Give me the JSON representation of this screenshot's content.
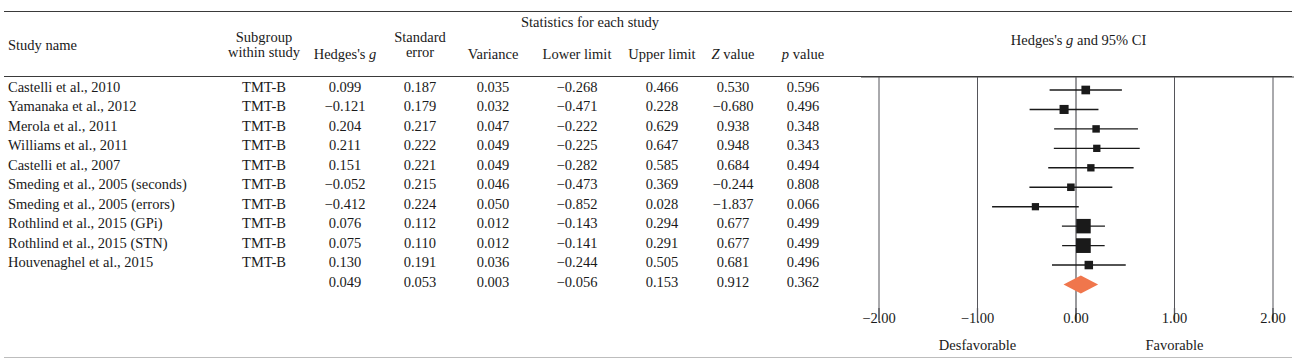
{
  "table": {
    "group_header": "Statistics for each study",
    "columns": [
      {
        "key": "study_name",
        "label": "Study name",
        "label2": ""
      },
      {
        "key": "subgroup",
        "label": "Subgroup",
        "label2": "within study"
      },
      {
        "key": "hedges_g",
        "label": "Hedges's g",
        "label2": ""
      },
      {
        "key": "standard_err",
        "label": "Standard",
        "label2": "error"
      },
      {
        "key": "variance",
        "label": "Variance",
        "label2": ""
      },
      {
        "key": "lower_limit",
        "label": "Lower limit",
        "label2": ""
      },
      {
        "key": "upper_limit",
        "label": "Upper limit",
        "label2": ""
      },
      {
        "key": "z_value",
        "label": "Z value",
        "label2": ""
      },
      {
        "key": "p_value",
        "label": "p value",
        "label2": ""
      }
    ],
    "rows": [
      {
        "study_name": "Castelli et al., 2010",
        "subgroup": "TMT-B",
        "hedges_g": "0.099",
        "standard_err": "0.187",
        "variance": "0.035",
        "lower_limit": "−0.268",
        "upper_limit": "0.466",
        "z_value": "0.530",
        "p_value": "0.596"
      },
      {
        "study_name": "Yamanaka et al., 2012",
        "subgroup": "TMT-B",
        "hedges_g": "−0.121",
        "standard_err": "0.179",
        "variance": "0.032",
        "lower_limit": "−0.471",
        "upper_limit": "0.228",
        "z_value": "−0.680",
        "p_value": "0.496"
      },
      {
        "study_name": "Merola et al., 2011",
        "subgroup": "TMT-B",
        "hedges_g": "0.204",
        "standard_err": "0.217",
        "variance": "0.047",
        "lower_limit": "−0.222",
        "upper_limit": "0.629",
        "z_value": "0.938",
        "p_value": "0.348"
      },
      {
        "study_name": "Williams et al., 2011",
        "subgroup": "TMT-B",
        "hedges_g": "0.211",
        "standard_err": "0.222",
        "variance": "0.049",
        "lower_limit": "−0.225",
        "upper_limit": "0.647",
        "z_value": "0.948",
        "p_value": "0.343"
      },
      {
        "study_name": "Castelli et al., 2007",
        "subgroup": "TMT-B",
        "hedges_g": "0.151",
        "standard_err": "0.221",
        "variance": "0.049",
        "lower_limit": "−0.282",
        "upper_limit": "0.585",
        "z_value": "0.684",
        "p_value": "0.494"
      },
      {
        "study_name": "Smeding et al., 2005 (seconds)",
        "subgroup": "TMT-B",
        "hedges_g": "−0.052",
        "standard_err": "0.215",
        "variance": "0.046",
        "lower_limit": "−0.473",
        "upper_limit": "0.369",
        "z_value": "−0.244",
        "p_value": "0.808"
      },
      {
        "study_name": "Smeding et al., 2005 (errors)",
        "subgroup": "TMT-B",
        "hedges_g": "−0.412",
        "standard_err": "0.224",
        "variance": "0.050",
        "lower_limit": "−0.852",
        "upper_limit": "0.028",
        "z_value": "−1.837",
        "p_value": "0.066"
      },
      {
        "study_name": "Rothlind et al., 2015 (GPi)",
        "subgroup": "TMT-B",
        "hedges_g": "0.076",
        "standard_err": "0.112",
        "variance": "0.012",
        "lower_limit": "−0.143",
        "upper_limit": "0.294",
        "z_value": "0.677",
        "p_value": "0.499"
      },
      {
        "study_name": "Rothlind et al., 2015 (STN)",
        "subgroup": "TMT-B",
        "hedges_g": "0.075",
        "standard_err": "0.110",
        "variance": "0.012",
        "lower_limit": "−0.141",
        "upper_limit": "0.291",
        "z_value": "0.677",
        "p_value": "0.499"
      },
      {
        "study_name": "Houvenaghel et al., 2015",
        "subgroup": "TMT-B",
        "hedges_g": "0.130",
        "standard_err": "0.191",
        "variance": "0.036",
        "lower_limit": "−0.244",
        "upper_limit": "0.505",
        "z_value": "0.681",
        "p_value": "0.496"
      },
      {
        "study_name": "",
        "subgroup": "",
        "hedges_g": "0.049",
        "standard_err": "0.053",
        "variance": "0.003",
        "lower_limit": "−0.056",
        "upper_limit": "0.153",
        "z_value": "0.912",
        "p_value": "0.362"
      }
    ]
  },
  "chart_data": {
    "type": "forest",
    "title": "Hedges's g and 95% CI",
    "xlabel": "",
    "xlim": [
      -2.0,
      2.0
    ],
    "xticks": [
      -2.0,
      -1.0,
      0.0,
      1.0,
      2.0
    ],
    "xtick_labels": [
      "−2.00",
      "−1.00",
      "0.00",
      "1.00",
      "2.00"
    ],
    "null_line": 0.0,
    "grid": true,
    "left_label": "Desfavorable",
    "right_label": "Favorable",
    "marker_color": "#1a1a1a",
    "summary_color": "#F0764C",
    "points": [
      {
        "label": "Castelli et al., 2010",
        "effect": 0.099,
        "lower": -0.268,
        "upper": 0.466,
        "weight": 0.187,
        "summary": false
      },
      {
        "label": "Yamanaka et al., 2012",
        "effect": -0.121,
        "lower": -0.471,
        "upper": 0.228,
        "weight": 0.179,
        "summary": false
      },
      {
        "label": "Merola et al., 2011",
        "effect": 0.204,
        "lower": -0.222,
        "upper": 0.629,
        "weight": 0.217,
        "summary": false
      },
      {
        "label": "Williams et al., 2011",
        "effect": 0.211,
        "lower": -0.225,
        "upper": 0.647,
        "weight": 0.222,
        "summary": false
      },
      {
        "label": "Castelli et al., 2007",
        "effect": 0.151,
        "lower": -0.282,
        "upper": 0.585,
        "weight": 0.221,
        "summary": false
      },
      {
        "label": "Smeding et al., 2005 (seconds)",
        "effect": -0.052,
        "lower": -0.473,
        "upper": 0.369,
        "weight": 0.215,
        "summary": false
      },
      {
        "label": "Smeding et al., 2005 (errors)",
        "effect": -0.412,
        "lower": -0.852,
        "upper": 0.028,
        "weight": 0.224,
        "summary": false
      },
      {
        "label": "Rothlind et al., 2015 (GPi)",
        "effect": 0.076,
        "lower": -0.143,
        "upper": 0.294,
        "weight": 0.112,
        "summary": false
      },
      {
        "label": "Rothlind et al., 2015 (STN)",
        "effect": 0.075,
        "lower": -0.141,
        "upper": 0.291,
        "weight": 0.11,
        "summary": false
      },
      {
        "label": "Houvenaghel et al., 2015",
        "effect": 0.13,
        "lower": -0.244,
        "upper": 0.505,
        "weight": 0.191,
        "summary": false
      },
      {
        "label": "Overall",
        "effect": 0.049,
        "lower": -0.056,
        "upper": 0.153,
        "weight": 0.053,
        "summary": true
      }
    ]
  },
  "layout": {
    "column_x": {
      "study_name": 8,
      "subgroup": 264,
      "hedges_g": 345,
      "standard_err": 420,
      "variance": 493,
      "lower_limit": 577,
      "upper_limit": 662,
      "z_value": 733,
      "p_value": 803
    },
    "plot": {
      "left": 861,
      "right": 1294,
      "zero_x": 1076,
      "px_per_unit": 98.5,
      "top": 77,
      "row_height": 19.45,
      "first_row_center": 90
    }
  }
}
